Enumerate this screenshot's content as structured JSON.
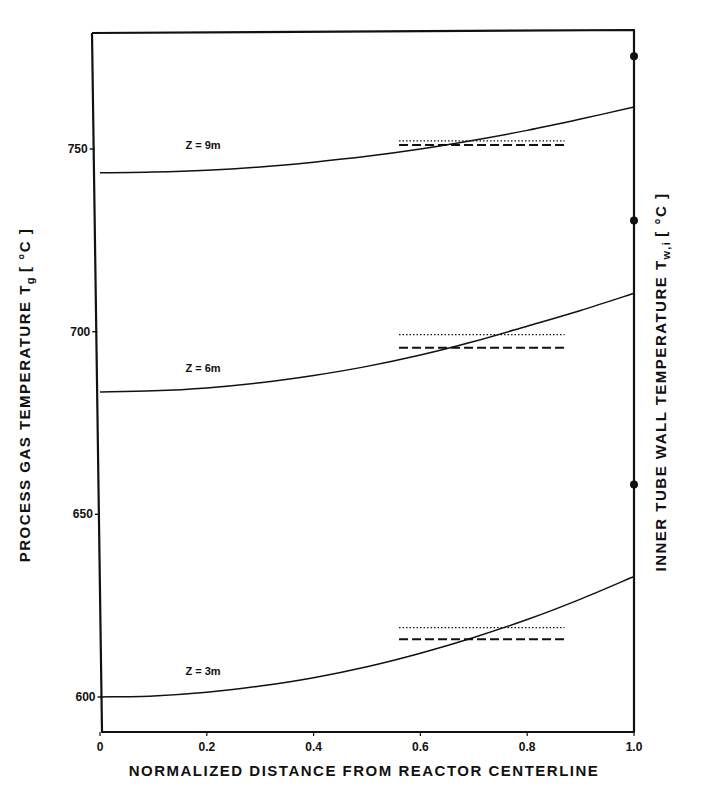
{
  "chart_data": {
    "type": "line",
    "title": "",
    "xlabel": "NORMALIZED DISTANCE FROM REACTOR CENTERLINE",
    "ylabel": "PROCESS GAS TEMPERATURE Tg [°C]",
    "ylabel_main": "PROCESS GAS TEMPERATURE T",
    "ylabel_sub": "g",
    "ylabel_unit": "[ °C ]",
    "y2label": "INNER TUBE WALL TEMPERATURE Tw,i [°C]",
    "y2label_main": "INNER TUBE WALL TEMPERATURE T",
    "y2label_sub": "w,i",
    "y2label_unit": "[ °C ]",
    "xlim": [
      0,
      1.0
    ],
    "ylim": [
      590,
      782
    ],
    "grid": false,
    "legend": "none (curves labeled inline)",
    "x_ticks": [
      "0",
      "0.2",
      "0.4",
      "0.6",
      "0.8",
      "1.0"
    ],
    "x_tick_values": [
      0,
      0.2,
      0.4,
      0.6,
      0.8,
      1.0
    ],
    "y_ticks": [
      "600",
      "650",
      "700",
      "750"
    ],
    "y_tick_values": [
      600,
      650,
      700,
      750
    ],
    "x": [
      0,
      0.1,
      0.2,
      0.3,
      0.4,
      0.5,
      0.6,
      0.7,
      0.8,
      0.9,
      1.0
    ],
    "series": [
      {
        "name": "Z = 9m",
        "style": "solid",
        "values": [
          743.5,
          743.7,
          744.2,
          745.1,
          746.4,
          748.0,
          750.0,
          752.4,
          755.1,
          758.2,
          761.5
        ],
        "reference_lines": [
          {
            "style": "dotted",
            "x_range": [
              0.56,
              0.87
            ],
            "value": 752.2
          },
          {
            "style": "dashed",
            "x_range": [
              0.56,
              0.87
            ],
            "value": 751.1
          }
        ]
      },
      {
        "name": "Z = 6m",
        "style": "solid",
        "values": [
          683.5,
          683.8,
          684.6,
          686.0,
          688.0,
          690.5,
          693.6,
          697.3,
          701.5,
          705.8,
          710.5
        ],
        "reference_lines": [
          {
            "style": "dotted",
            "x_range": [
              0.56,
              0.87
            ],
            "value": 699.2
          },
          {
            "style": "dashed",
            "x_range": [
              0.56,
              0.87
            ],
            "value": 695.6
          }
        ]
      },
      {
        "name": "Z = 3m",
        "style": "solid",
        "values": [
          600.0,
          600.3,
          601.3,
          603.0,
          605.3,
          608.3,
          612.0,
          616.3,
          621.2,
          626.8,
          633.0
        ],
        "reference_lines": [
          {
            "style": "dotted",
            "x_range": [
              0.56,
              0.87
            ],
            "value": 619.0
          },
          {
            "style": "dashed",
            "x_range": [
              0.56,
              0.87
            ],
            "value": 615.8
          }
        ]
      }
    ],
    "wall_temperature_points": [
      {
        "x": 1.0,
        "value": 775.4
      },
      {
        "x": 1.0,
        "value": 730.4
      },
      {
        "x": 1.0,
        "value": 658.2
      }
    ],
    "curve_labels": [
      {
        "text": "Z = 9m",
        "x": 0.16,
        "y": 750
      },
      {
        "text": "Z = 6m",
        "x": 0.16,
        "y": 689
      },
      {
        "text": "Z = 3m",
        "x": 0.16,
        "y": 606
      }
    ]
  }
}
